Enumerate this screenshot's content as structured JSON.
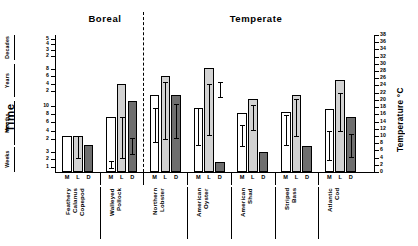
{
  "figure": {
    "regions": [
      {
        "name": "Boreal"
      },
      {
        "name": "Temperate"
      }
    ],
    "y_axis_title": "Time",
    "y2_axis_title": "Temperature °C",
    "series_legend": [
      "M",
      "L",
      "D"
    ]
  },
  "chart_data": {
    "type": "bar",
    "title": "",
    "xlabel": "",
    "ylabel": "Time",
    "y2label": "Temperature °C",
    "grid": false,
    "legend_position": "none",
    "y_axis_segments": [
      {
        "name": "Decades",
        "ticks": [
          2,
          3,
          4,
          5
        ]
      },
      {
        "name": "Years",
        "ticks": [
          2,
          4,
          6,
          8
        ]
      },
      {
        "name": "Months",
        "ticks": [
          2,
          4,
          6,
          8,
          10
        ]
      },
      {
        "name": "Weeks",
        "ticks": [
          1,
          2,
          3
        ]
      }
    ],
    "y2_axis": {
      "label": "Temperature °C",
      "ticks": [
        0,
        2,
        4,
        6,
        8,
        10,
        12,
        14,
        16,
        18,
        20,
        22,
        24,
        26,
        28,
        30,
        32,
        34,
        36,
        38
      ],
      "range": [
        0,
        38
      ]
    },
    "bar_letters": [
      "M",
      "L",
      "D"
    ],
    "categories": [
      "Feathery\nCalanus\nCopepod",
      "Walleyed\nPollock",
      "Northern\nLobster",
      "American\nOyster",
      "American\nShad",
      "Striped\nBass",
      "Atlantic\nCod"
    ],
    "region_of_category": [
      "Boreal",
      "Boreal",
      "Temperate",
      "Temperate",
      "Temperate",
      "Temperate",
      "Temperate"
    ],
    "series": [
      {
        "name": "M",
        "values": [
          26,
          40,
          56,
          47,
          43,
          44,
          46
        ],
        "err_low": [
          null,
          3,
          22,
          20,
          19,
          20,
          9
        ],
        "err_high": [
          null,
          8,
          47,
          47,
          34,
          42,
          30
        ]
      },
      {
        "name": "L",
        "values": [
          26,
          64,
          70,
          76,
          53,
          56,
          67
        ],
        "err_low": [
          10,
          10,
          24,
          27,
          31,
          26,
          30
        ],
        "err_high": [
          26,
          40,
          66,
          64,
          49,
          53,
          58
        ]
      },
      {
        "name": "D",
        "values": [
          20,
          52,
          56,
          7,
          15,
          19,
          40
        ],
        "err_low": [
          null,
          13,
          25,
          55,
          null,
          null,
          11
        ],
        "err_high": [
          null,
          25,
          50,
          66,
          null,
          null,
          28
        ]
      }
    ]
  }
}
